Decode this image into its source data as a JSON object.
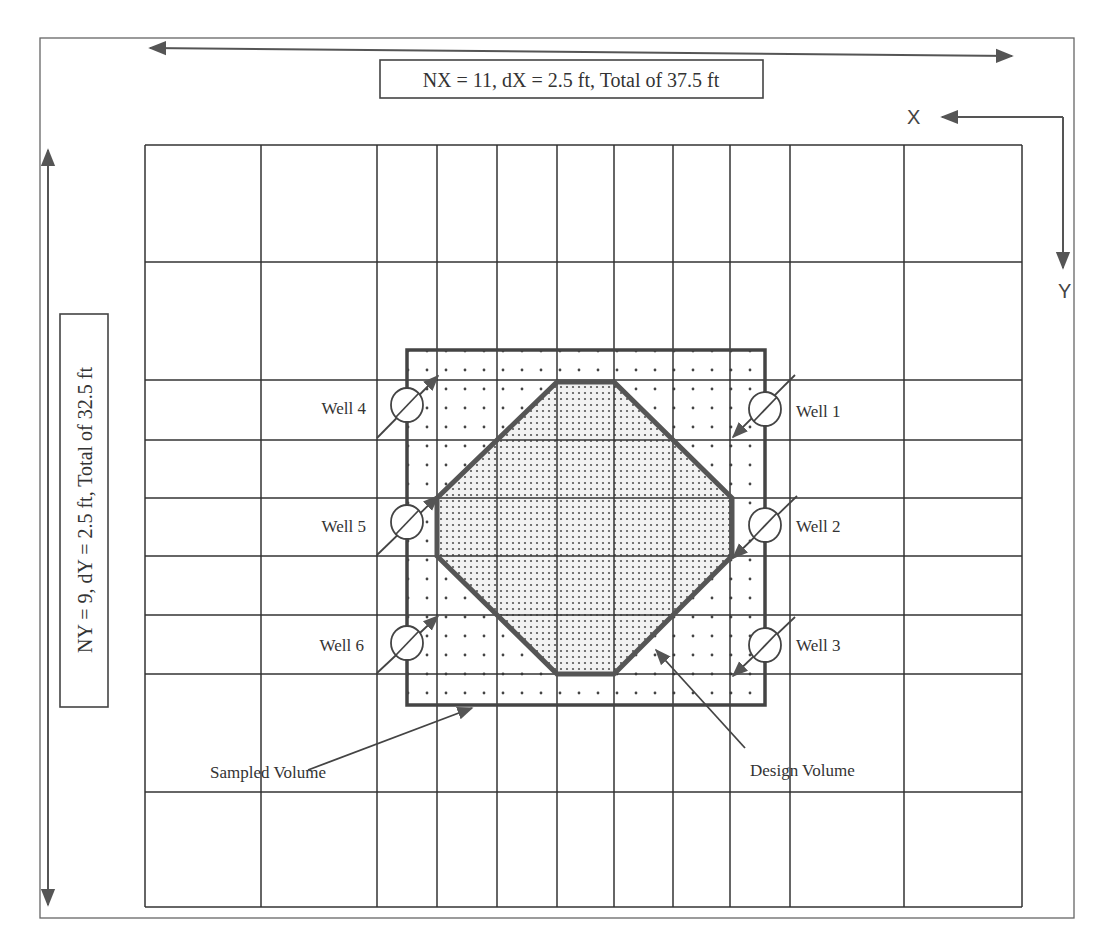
{
  "diagram": {
    "x_dimension_label": "NX = 11, dX = 2.5 ft, Total of 37.5 ft",
    "y_dimension_label": "NY = 9, dY = 2.5 ft, Total  of 32.5 ft",
    "axis_x_label": "X",
    "axis_y_label": "Y",
    "grid": {
      "nx": 11,
      "ny": 9,
      "cell_size_ft": 2.5,
      "x_lines_px": [
        145,
        261,
        377,
        437,
        497,
        557,
        614,
        673,
        730,
        790,
        904,
        1022
      ],
      "y_lines_px": [
        145,
        262,
        380,
        440,
        498,
        556,
        615,
        674,
        792,
        907
      ]
    },
    "wells": [
      {
        "label": "Well 1",
        "side": "right"
      },
      {
        "label": "Well 2",
        "side": "right"
      },
      {
        "label": "Well 3",
        "side": "right"
      },
      {
        "label": "Well 4",
        "side": "left"
      },
      {
        "label": "Well 5",
        "side": "left"
      },
      {
        "label": "Well 6",
        "side": "left"
      }
    ],
    "regions": {
      "sampled_volume_label": "Sampled Volume",
      "design_volume_label": "Design Volume"
    },
    "colors": {
      "line": "#333333",
      "frame": "#555555",
      "design_fill": "#d9d9d9",
      "dot": "#444444"
    }
  }
}
